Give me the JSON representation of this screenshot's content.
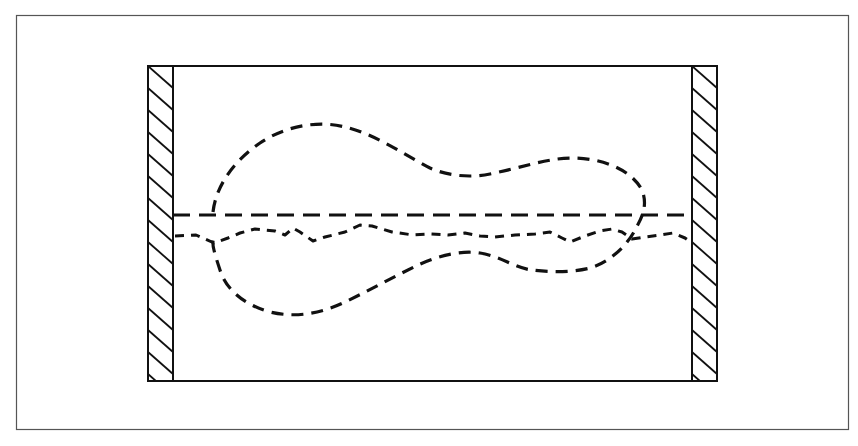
{
  "figure": {
    "type": "schematic diagram",
    "colors": {
      "background": "#ffffff",
      "ink": "#111111",
      "frame": "#555555"
    },
    "elements": {
      "outer_frame": "rectangular border",
      "left_wall": "hatched wall (left)",
      "right_wall": "hatched wall (right)",
      "channel_box": "rectangular channel",
      "centerline": "long-dashed horizontal line",
      "wavy_line": "short-dashed irregular line",
      "contour": "dashed closed dumbbell-shaped curve"
    }
  }
}
